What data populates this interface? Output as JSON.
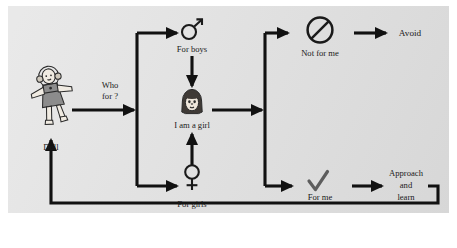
{
  "figure": {
    "type": "flowchart",
    "background_color": "#dedede",
    "page_color": "#ffffff",
    "line_color": "#111111",
    "text_color": "#1a1a1a",
    "orientation": "left-to-right"
  },
  "nodes": {
    "doll": {
      "label": "Doll",
      "icon": "doll-figure-icon"
    },
    "for_boys": {
      "label": "For boys",
      "icon": "male-gender-symbol-icon"
    },
    "for_girls": {
      "label": "For girls",
      "icon": "female-gender-symbol-icon"
    },
    "i_am_a_girl": {
      "label": "I am a girl",
      "icon": "girl-face-icon"
    },
    "not_for_me": {
      "label": "Not for me",
      "icon": "prohibition-circle-slash-icon"
    },
    "for_me": {
      "label": "For me",
      "icon": "checkmark-icon"
    },
    "avoid": {
      "label": "Avoid"
    },
    "approach_and_learn": {
      "label_line1": "Approach",
      "label_line2": "and",
      "label_line3": "learn"
    }
  },
  "edges": {
    "who_for": {
      "label_line1": "Who",
      "label_line2": "for ?",
      "from": "doll",
      "to": "split"
    }
  }
}
